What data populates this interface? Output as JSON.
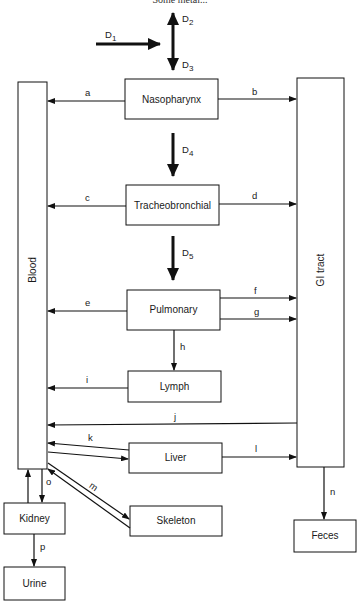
{
  "header": {
    "text": "Some metal..."
  },
  "colors": {
    "line": "#111111",
    "box_fill": "#ffffff",
    "background": "#ffffff"
  },
  "compartments": {
    "blood": "Blood",
    "gi_tract": "GI tract",
    "nasopharynx": "Nasopharynx",
    "tracheobronchial": "Tracheobronchial",
    "pulmonary": "Pulmonary",
    "lymph": "Lymph",
    "liver": "Liver",
    "skeleton": "Skeleton",
    "kidney": "Kidney",
    "urine": "Urine",
    "feces": "Feces"
  },
  "deposition": {
    "d1": {
      "main": "D",
      "sub": "1"
    },
    "d2": {
      "main": "D",
      "sub": "2"
    },
    "d3": {
      "main": "D",
      "sub": "3"
    },
    "d4": {
      "main": "D",
      "sub": "4"
    },
    "d5": {
      "main": "D",
      "sub": "5"
    }
  },
  "pathways": {
    "a": "a",
    "b": "b",
    "c": "c",
    "d": "d",
    "e": "e",
    "f": "f",
    "g": "g",
    "h": "h",
    "i": "i",
    "j": "j",
    "k": "k",
    "l": "l",
    "m": "m",
    "n": "n",
    "o": "o",
    "p": "p"
  },
  "edges": [
    {
      "id": "a",
      "from": "Nasopharynx",
      "to": "Blood"
    },
    {
      "id": "b",
      "from": "Nasopharynx",
      "to": "GI tract"
    },
    {
      "id": "c",
      "from": "Tracheobronchial",
      "to": "Blood"
    },
    {
      "id": "d",
      "from": "Tracheobronchial",
      "to": "GI tract"
    },
    {
      "id": "e",
      "from": "Pulmonary",
      "to": "Blood"
    },
    {
      "id": "f",
      "from": "Pulmonary",
      "to": "GI tract"
    },
    {
      "id": "g",
      "from": "Pulmonary",
      "to": "GI tract"
    },
    {
      "id": "h",
      "from": "Pulmonary",
      "to": "Lymph"
    },
    {
      "id": "i",
      "from": "Lymph",
      "to": "Blood"
    },
    {
      "id": "j",
      "from": "GI tract",
      "to": "Blood"
    },
    {
      "id": "k",
      "from": "Liver",
      "to": "Blood",
      "bidirectional": true
    },
    {
      "id": "l",
      "from": "Liver",
      "to": "GI tract"
    },
    {
      "id": "m",
      "from": "Skeleton",
      "to": "Blood",
      "bidirectional": true
    },
    {
      "id": "n",
      "from": "GI tract",
      "to": "Feces"
    },
    {
      "id": "o",
      "from": "Blood",
      "to": "Kidney",
      "bidirectional": true
    },
    {
      "id": "p",
      "from": "Kidney",
      "to": "Urine"
    },
    {
      "id": "D1",
      "to": "inhaled deposition"
    },
    {
      "id": "D2",
      "direction": "exhaled"
    },
    {
      "id": "D3",
      "to": "Nasopharynx"
    },
    {
      "id": "D4",
      "from": "Nasopharynx",
      "to": "Tracheobronchial"
    },
    {
      "id": "D5",
      "from": "Tracheobronchial",
      "to": "Pulmonary"
    }
  ]
}
